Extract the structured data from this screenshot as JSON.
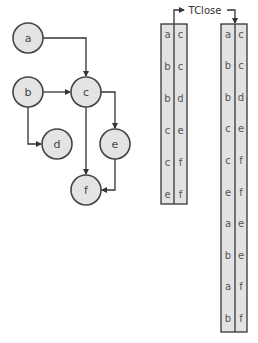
{
  "graph": {
    "nodes": [
      {
        "id": "a",
        "label": "a",
        "x": 28,
        "y": 38
      },
      {
        "id": "b",
        "label": "b",
        "x": 28,
        "y": 92
      },
      {
        "id": "c",
        "label": "c",
        "x": 86,
        "y": 92
      },
      {
        "id": "d",
        "label": "d",
        "x": 57,
        "y": 144
      },
      {
        "id": "e",
        "label": "e",
        "x": 115,
        "y": 144
      },
      {
        "id": "f",
        "label": "f",
        "x": 86,
        "y": 190
      }
    ],
    "edges": [
      {
        "from": "a",
        "to": "c"
      },
      {
        "from": "b",
        "to": "c"
      },
      {
        "from": "b",
        "to": "d"
      },
      {
        "from": "c",
        "to": "e"
      },
      {
        "from": "c",
        "to": "f"
      },
      {
        "from": "e",
        "to": "f"
      }
    ]
  },
  "operation_label": "TClose",
  "input_table": {
    "rows": [
      [
        "a",
        "c"
      ],
      [
        "b",
        "c"
      ],
      [
        "b",
        "d"
      ],
      [
        "c",
        "e"
      ],
      [
        "c",
        "f"
      ],
      [
        "e",
        "f"
      ]
    ]
  },
  "output_table": {
    "rows": [
      [
        "a",
        "c"
      ],
      [
        "b",
        "c"
      ],
      [
        "b",
        "d"
      ],
      [
        "c",
        "e"
      ],
      [
        "c",
        "f"
      ],
      [
        "e",
        "f"
      ],
      [
        "a",
        "e"
      ],
      [
        "b",
        "e"
      ],
      [
        "a",
        "f"
      ],
      [
        "b",
        "f"
      ]
    ]
  }
}
